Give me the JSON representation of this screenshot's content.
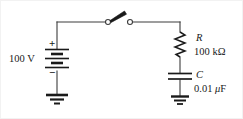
{
  "figure": {
    "background_color": "#ffffff",
    "line_color": "#3c3c3c",
    "text_color": "#1a1a1a"
  },
  "source": {
    "name": "battery",
    "value_label": "100 V",
    "positive_terminal": "+",
    "negative_terminal": "−"
  },
  "switch": {
    "name": "knife-switch",
    "state": "open"
  },
  "resistor": {
    "name": "R",
    "value_label": "100 kΩ"
  },
  "capacitor": {
    "name": "C",
    "value_label_prefix": "0.01 ",
    "value_label_unit_mu": "μ",
    "value_label_unit_rest": "F"
  },
  "grounds": [
    {
      "name": "ground-left"
    },
    {
      "name": "ground-right"
    }
  ]
}
